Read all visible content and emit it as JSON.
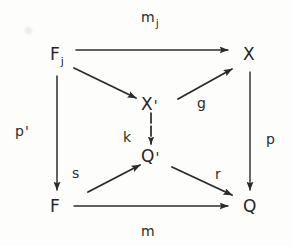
{
  "diagram": {
    "kind": "commutative-diagram",
    "ink_color": "#262626",
    "background_color": "#fdfdfc",
    "nodes": [
      {
        "id": "Fj",
        "base": "F",
        "sub": "j",
        "prime": "",
        "x": 50,
        "y": 56
      },
      {
        "id": "X",
        "base": "X",
        "sub": "",
        "prime": "",
        "x": 245,
        "y": 56
      },
      {
        "id": "Xp",
        "base": "X",
        "sub": "",
        "prime": "'",
        "x": 148,
        "y": 104
      },
      {
        "id": "Qp",
        "base": "Q",
        "sub": "",
        "prime": "'",
        "x": 148,
        "y": 158
      },
      {
        "id": "F",
        "base": "F",
        "sub": "",
        "prime": "",
        "x": 50,
        "y": 208
      },
      {
        "id": "Q",
        "base": "Q",
        "sub": "",
        "prime": "",
        "x": 245,
        "y": 208
      }
    ],
    "edges": [
      {
        "id": "m_j",
        "from": "Fj",
        "to": "X",
        "label_base": "m",
        "label_sub": "j",
        "label_prime": "",
        "style": "solid"
      },
      {
        "id": "pprime",
        "from": "Fj",
        "to": "F",
        "label_base": "p",
        "label_sub": "",
        "label_prime": "'",
        "style": "solid"
      },
      {
        "id": "fj_to_xp",
        "from": "Fj",
        "to": "Xp",
        "label_base": "",
        "label_sub": "",
        "label_prime": "",
        "style": "solid"
      },
      {
        "id": "g",
        "from": "Xp",
        "to": "X",
        "label_base": "g",
        "label_sub": "",
        "label_prime": "",
        "style": "solid"
      },
      {
        "id": "k",
        "from": "Xp",
        "to": "Qp",
        "label_base": "k",
        "label_sub": "",
        "label_prime": "",
        "style": "dashed"
      },
      {
        "id": "p",
        "from": "X",
        "to": "Q",
        "label_base": "p",
        "label_sub": "",
        "label_prime": "",
        "style": "solid"
      },
      {
        "id": "s",
        "from": "F",
        "to": "Qp",
        "label_base": "s",
        "label_sub": "",
        "label_prime": "",
        "style": "solid"
      },
      {
        "id": "r",
        "from": "Qp",
        "to": "Q",
        "label_base": "r",
        "label_sub": "",
        "label_prime": "",
        "style": "solid"
      },
      {
        "id": "m",
        "from": "F",
        "to": "Q",
        "label_base": "m",
        "label_sub": "",
        "label_prime": "",
        "style": "solid"
      }
    ],
    "labels": {
      "m_j": {
        "base": "m",
        "sub": "j",
        "x": 140,
        "y": 14
      },
      "p_prime": {
        "base": "p",
        "prime": "'",
        "x": 14,
        "y": 130
      },
      "g": {
        "base": "g",
        "x": 198,
        "y": 92
      },
      "k": {
        "base": "k",
        "x": 122,
        "y": 130
      },
      "p": {
        "base": "p",
        "x": 265,
        "y": 132
      },
      "s": {
        "base": "s",
        "x": 68,
        "y": 166
      },
      "r": {
        "base": "r",
        "x": 215,
        "y": 166
      },
      "m": {
        "base": "m",
        "x": 140,
        "y": 226
      }
    },
    "node_text": {
      "Fj": {
        "base": "F",
        "sub": "j"
      },
      "X": {
        "base": "X"
      },
      "Xp": {
        "base": "X",
        "prime": "'"
      },
      "Qp": {
        "base": "Q",
        "prime": "'"
      },
      "F": {
        "base": "F"
      },
      "Q": {
        "base": "Q"
      }
    }
  }
}
